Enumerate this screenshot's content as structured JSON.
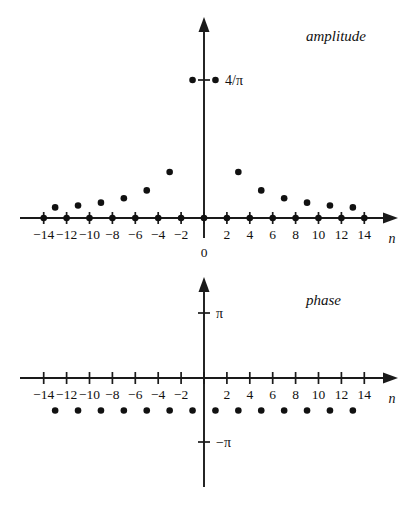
{
  "figure": {
    "title": "",
    "x_axis_name": "n",
    "origin_label": "0"
  },
  "panels": {
    "amplitude": {
      "label": "amplitude",
      "y_tick_label": "4/π",
      "x_tick_labels": [
        "−14",
        "−12",
        "−10",
        "−8",
        "−6",
        "−4",
        "−2",
        "2",
        "4",
        "6",
        "8",
        "10",
        "12",
        "14"
      ]
    },
    "phase": {
      "label": "phase",
      "y_tick_labels": [
        "π",
        "−π"
      ],
      "x_tick_labels": [
        "−14",
        "−12",
        "−10",
        "−8",
        "−6",
        "−4",
        "−2",
        "2",
        "4",
        "6",
        "8",
        "10",
        "12",
        "14"
      ]
    }
  },
  "colors": {
    "ink": "#111111",
    "axis": "#1a1a1a",
    "background": "#ffffff"
  },
  "chart_data": [
    {
      "type": "scatter",
      "name": "amplitude-spectrum",
      "title": "amplitude",
      "xlabel": "n",
      "ylabel": "4/π",
      "xlim": [
        -15,
        15
      ],
      "ylim": [
        0,
        1.6
      ],
      "grid": false,
      "legend": "none",
      "x_ticks": [
        -14,
        -12,
        -10,
        -8,
        -6,
        -4,
        -2,
        0,
        2,
        4,
        6,
        8,
        10,
        12,
        14
      ],
      "x_tick_labels": [
        "−14",
        "−12",
        "−10",
        "−8",
        "−6",
        "−4",
        "−2",
        "0",
        "2",
        "4",
        "6",
        "8",
        "10",
        "12",
        "14"
      ],
      "y_ticks": [
        1.2732
      ],
      "y_tick_labels": [
        "4/π"
      ],
      "annotations": [
        "amplitude = 4/(π|n|) for odd n, 0 for even n"
      ],
      "x": [
        -14,
        -13,
        -12,
        -11,
        -10,
        -9,
        -8,
        -7,
        -6,
        -5,
        -4,
        -3,
        -2,
        -1,
        0,
        1,
        2,
        3,
        4,
        5,
        6,
        7,
        8,
        9,
        10,
        11,
        12,
        13,
        14
      ],
      "y": [
        0,
        0.098,
        0,
        0.1157,
        0,
        0.1415,
        0,
        0.1819,
        0,
        0.2546,
        0,
        0.4244,
        0,
        1.2732,
        0,
        1.2732,
        0,
        0.4244,
        0,
        0.2546,
        0,
        0.1819,
        0,
        0.1415,
        0,
        0.1157,
        0,
        0.098,
        0
      ]
    },
    {
      "type": "scatter",
      "name": "phase-spectrum",
      "title": "phase",
      "xlabel": "n",
      "ylabel": "",
      "xlim": [
        -15,
        15
      ],
      "ylim": [
        -4.2,
        4.2
      ],
      "grid": false,
      "legend": "none",
      "x_ticks": [
        -14,
        -12,
        -10,
        -8,
        -6,
        -4,
        -2,
        0,
        2,
        4,
        6,
        8,
        10,
        12,
        14
      ],
      "x_tick_labels": [
        "−14",
        "−12",
        "−10",
        "−8",
        "−6",
        "−4",
        "−2",
        "0",
        "2",
        "4",
        "6",
        "8",
        "10",
        "12",
        "14"
      ],
      "y_ticks": [
        3.1416,
        -3.1416
      ],
      "y_tick_labels": [
        "π",
        "−π"
      ],
      "annotations": [
        "phase = −π/2 for all odd n"
      ],
      "x": [
        -13,
        -11,
        -9,
        -7,
        -5,
        -3,
        -1,
        1,
        3,
        5,
        7,
        9,
        11,
        13
      ],
      "y": [
        -1.5708,
        -1.5708,
        -1.5708,
        -1.5708,
        -1.5708,
        -1.5708,
        -1.5708,
        -1.5708,
        -1.5708,
        -1.5708,
        -1.5708,
        -1.5708,
        -1.5708,
        -1.5708
      ]
    }
  ]
}
